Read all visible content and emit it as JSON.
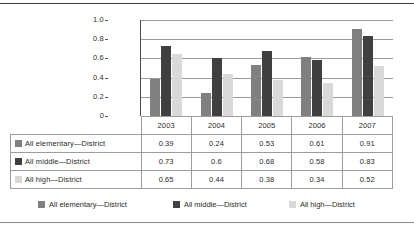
{
  "chart_data": {
    "type": "bar",
    "title": "",
    "xlabel": "",
    "ylabel": "",
    "categories": [
      "2003",
      "2004",
      "2005",
      "2006",
      "2007"
    ],
    "series": [
      {
        "name": "All elementary—District",
        "color": "#808080",
        "values": [
          0.39,
          0.24,
          0.53,
          0.61,
          0.91
        ],
        "labels": [
          "0.39",
          "0.24",
          "0.53",
          "0.61",
          "0.91"
        ]
      },
      {
        "name": "All middle—District",
        "color": "#404040",
        "values": [
          0.73,
          0.6,
          0.68,
          0.58,
          0.83
        ],
        "labels": [
          "0.73",
          "0.6",
          "0.68",
          "0.58",
          "0.83"
        ]
      },
      {
        "name": "All high—District",
        "color": "#d9d9d9",
        "values": [
          0.65,
          0.44,
          0.38,
          0.34,
          0.52
        ],
        "labels": [
          "0.65",
          "0.44",
          "0.38",
          "0.34",
          "0.52"
        ]
      }
    ],
    "ylim": [
      0,
      1.0
    ],
    "yticks": [
      {
        "value": 1.0,
        "label": "1.0"
      },
      {
        "value": 0.8,
        "label": "0.8"
      },
      {
        "value": 0.6,
        "label": "0.6"
      },
      {
        "value": 0.4,
        "label": "0.4"
      },
      {
        "value": 0.2,
        "label": "0.2"
      },
      {
        "value": 0.0,
        "label": "0"
      }
    ],
    "grid": true,
    "legend_position": "bottom",
    "data_table_visible": true
  },
  "legend": {
    "items": [
      {
        "label": "All elementary—District",
        "color": "#808080"
      },
      {
        "label": "All middle—District",
        "color": "#404040"
      },
      {
        "label": "All high—District",
        "color": "#d9d9d9"
      }
    ]
  }
}
